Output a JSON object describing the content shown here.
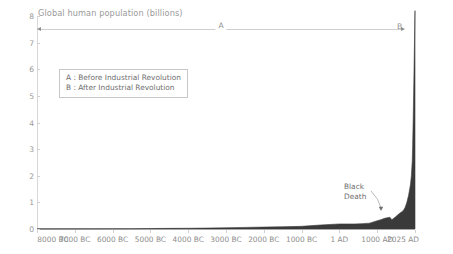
{
  "chart_data": {
    "type": "area",
    "title": "Global human population (billions)",
    "xlabel": "",
    "ylabel": "",
    "ylim": [
      0,
      8
    ],
    "yticks": [
      0,
      1,
      2,
      3,
      4,
      5,
      6,
      7,
      8
    ],
    "ytick_labels": [
      "0",
      "1",
      "2",
      "3",
      "4",
      "5",
      "6",
      "7",
      "8"
    ],
    "xtick_labels": [
      "8000 BC",
      "7000 BC",
      "6000 BC",
      "5000 BC",
      "4000 BC",
      "3000 BC",
      "2000 BC",
      "1000 BC",
      "1 AD",
      "1000 AD",
      "2025 AD"
    ],
    "xtick_positions": [
      0,
      1,
      2,
      3,
      4,
      5,
      6,
      7,
      8,
      9,
      10
    ],
    "grid": false,
    "legend_position": "inside-upper-left",
    "series_name": "Global human population",
    "fill_color": "#3a3a3a",
    "x": [
      -8000,
      -7500,
      -7000,
      -6500,
      -6000,
      -5500,
      -5000,
      -4500,
      -4000,
      -3500,
      -3000,
      -2500,
      -2000,
      -1500,
      -1000,
      -500,
      1,
      200,
      400,
      600,
      800,
      1000,
      1100,
      1200,
      1300,
      1340,
      1400,
      1500,
      1600,
      1700,
      1750,
      1800,
      1850,
      1900,
      1927,
      1950,
      1960,
      1974,
      1987,
      1999,
      2011,
      2022,
      2025
    ],
    "values": [
      0.005,
      0.006,
      0.007,
      0.009,
      0.01,
      0.013,
      0.018,
      0.024,
      0.028,
      0.035,
      0.045,
      0.06,
      0.072,
      0.085,
      0.1,
      0.15,
      0.19,
      0.19,
      0.19,
      0.2,
      0.22,
      0.31,
      0.35,
      0.4,
      0.43,
      0.44,
      0.35,
      0.46,
      0.58,
      0.68,
      0.79,
      0.98,
      1.26,
      1.65,
      2.0,
      2.54,
      3.03,
      4.0,
      5.0,
      6.0,
      7.0,
      8.0,
      8.2
    ],
    "annotations": [
      {
        "name": "black-death",
        "label_line1": "Black",
        "label_line2": "Death",
        "x": 1350,
        "y": 0.37
      },
      {
        "name": "span-a",
        "label": "A",
        "type": "range-arrow",
        "x_start": -8000,
        "x_end": 1760,
        "y": 7.5
      },
      {
        "name": "span-b",
        "label": "B",
        "type": "marker",
        "x_start": 1760,
        "x_end": 2025,
        "y": 7.5
      }
    ],
    "legend_entries": [
      "A :  Before Industrial Revolution",
      "B :  After Industrial Revolution"
    ]
  },
  "chart": {
    "title": "Global human population (billions)",
    "span_a_label": "A",
    "span_b_label": "B",
    "black_death_line1": "Black",
    "black_death_line2": "Death"
  },
  "legend": {
    "row_a": "A :  Before Industrial Revolution",
    "row_b": "B :  After Industrial Revolution"
  }
}
